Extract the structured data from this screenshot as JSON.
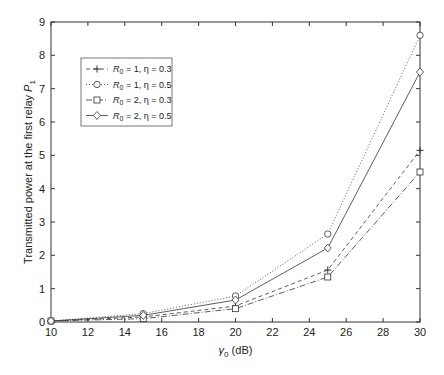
{
  "chart_data": {
    "type": "line",
    "title": "",
    "xlabel": "γ0 (dB)",
    "ylabel": "Transmitted power at the first relay P1",
    "x": [
      10,
      15,
      20,
      25,
      30
    ],
    "xlim": [
      10,
      30
    ],
    "ylim": [
      0,
      9
    ],
    "xticks": [
      10,
      12,
      14,
      16,
      18,
      20,
      22,
      24,
      26,
      28,
      30
    ],
    "yticks": [
      0,
      1,
      2,
      3,
      4,
      5,
      6,
      7,
      8,
      9
    ],
    "grid": false,
    "legend_position": "upper left",
    "series": [
      {
        "name": "R0 = 1, η = 0.3",
        "marker": "plus",
        "linestyle": "dashed",
        "values": [
          0.03,
          0.15,
          0.48,
          1.56,
          5.15
        ]
      },
      {
        "name": "R0 = 1, η = 0.5",
        "marker": "circle",
        "linestyle": "dotted",
        "values": [
          0.03,
          0.25,
          0.78,
          2.64,
          8.6
        ]
      },
      {
        "name": "R0 = 2, η = 0.3",
        "marker": "square",
        "linestyle": "dashdot",
        "values": [
          0.03,
          0.1,
          0.4,
          1.35,
          4.5
        ]
      },
      {
        "name": "R0 = 2, η = 0.5",
        "marker": "diamond",
        "linestyle": "solid",
        "values": [
          0.03,
          0.2,
          0.66,
          2.22,
          7.5
        ]
      }
    ]
  },
  "legend": {
    "items": [
      {
        "r": "R",
        "sub": "0",
        "rest": " = 1, η = 0.3"
      },
      {
        "r": "R",
        "sub": "0",
        "rest": " = 1, η = 0.5"
      },
      {
        "r": "R",
        "sub": "0",
        "rest": " = 2, η = 0.3"
      },
      {
        "r": "R",
        "sub": "0",
        "rest": " = 2, η = 0.5"
      }
    ]
  },
  "labels": {
    "xlabel_main": "γ",
    "xlabel_sub": "0",
    "xlabel_rest": " (dB)",
    "ylabel_main": "Transmitted power at the first relay ",
    "ylabel_p": "P",
    "ylabel_sub": "1"
  }
}
